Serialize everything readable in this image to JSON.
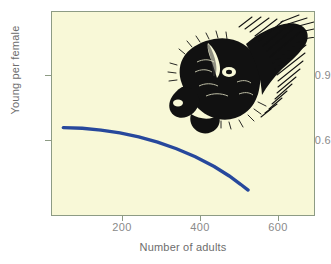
{
  "figure": {
    "background_color": "#ffffff",
    "plot_background_color": "#f8f8d7",
    "axis_color": "#8d9b84",
    "label_color": "#6d6d6d",
    "tick_label_color": "#8a8a8a"
  },
  "axes": {
    "ylabel": "Young per female",
    "xlabel": "Number of adults",
    "yticks": [
      "0.9",
      "0.6"
    ],
    "xticks": [
      "200",
      "400",
      "600"
    ]
  },
  "illustration": {
    "name": "bison-head-illustration",
    "subject": "bison",
    "color": "#111111"
  },
  "chart_data": {
    "type": "line",
    "title": "",
    "subtitle": "",
    "xlabel": "Number of adults",
    "ylabel": "Young per female",
    "xlim": [
      0,
      700
    ],
    "ylim": [
      0.38,
      1.05
    ],
    "xticks": [
      200,
      400,
      600
    ],
    "yticks": [
      0.6,
      0.9
    ],
    "grid": false,
    "legend": null,
    "annotations": [
      {
        "type": "image",
        "label": "bison head illustration",
        "x_range": [
          280,
          560
        ],
        "y_range": [
          0.68,
          1.04
        ]
      }
    ],
    "series": [
      {
        "name": "Young per female",
        "color": "#27489c",
        "line_width": 3,
        "x": [
          30,
          80,
          130,
          180,
          230,
          280,
          330,
          380,
          430,
          470,
          500,
          520
        ],
        "y": [
          0.672,
          0.67,
          0.664,
          0.655,
          0.642,
          0.625,
          0.603,
          0.577,
          0.545,
          0.514,
          0.487,
          0.468
        ]
      }
    ]
  }
}
